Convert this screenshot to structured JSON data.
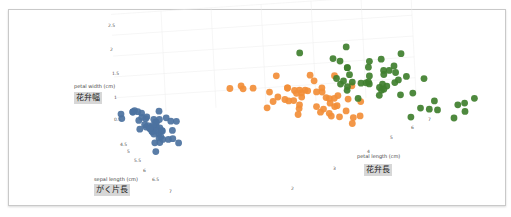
{
  "chart_data": {
    "type": "scatter",
    "projection": "3d",
    "title": "",
    "axes": {
      "x": {
        "label": "sepal length (cm)",
        "label_ja": "がく片長",
        "ticks": [
          "4.5",
          "5",
          "5.5",
          "6",
          "6.5",
          "7"
        ],
        "range": [
          4.3,
          7.9
        ]
      },
      "y": {
        "label": "petal length (cm)",
        "label_ja": "花弁長",
        "ticks": [
          "2",
          "3",
          "4",
          "5",
          "6",
          "7"
        ],
        "range": [
          1,
          6.9
        ]
      },
      "z": {
        "label": "petal width (cm)",
        "label_ja": "花弁幅",
        "ticks": [
          "0.5",
          "1",
          "1.5",
          "2",
          "2.5"
        ],
        "range": [
          0.1,
          2.5
        ]
      }
    },
    "grid": true,
    "legend": "none",
    "series": [
      {
        "name": "setosa",
        "color": "#4c72a0",
        "points": [
          [
            5.1,
            1.4,
            0.2
          ],
          [
            4.9,
            1.4,
            0.2
          ],
          [
            4.7,
            1.3,
            0.2
          ],
          [
            4.6,
            1.5,
            0.2
          ],
          [
            5.0,
            1.4,
            0.2
          ],
          [
            5.4,
            1.7,
            0.4
          ],
          [
            4.6,
            1.4,
            0.3
          ],
          [
            5.0,
            1.5,
            0.2
          ],
          [
            4.4,
            1.4,
            0.2
          ],
          [
            4.9,
            1.5,
            0.1
          ],
          [
            5.4,
            1.5,
            0.2
          ],
          [
            4.8,
            1.6,
            0.2
          ],
          [
            4.8,
            1.4,
            0.1
          ],
          [
            4.3,
            1.1,
            0.1
          ],
          [
            5.8,
            1.2,
            0.2
          ],
          [
            5.7,
            1.5,
            0.4
          ],
          [
            5.4,
            1.3,
            0.4
          ],
          [
            5.1,
            1.4,
            0.3
          ],
          [
            5.7,
            1.7,
            0.3
          ],
          [
            5.1,
            1.5,
            0.3
          ],
          [
            5.4,
            1.7,
            0.2
          ],
          [
            5.1,
            1.5,
            0.4
          ],
          [
            4.6,
            1.0,
            0.2
          ],
          [
            5.1,
            1.7,
            0.5
          ],
          [
            4.8,
            1.9,
            0.2
          ],
          [
            5.0,
            1.6,
            0.2
          ],
          [
            5.0,
            1.6,
            0.4
          ],
          [
            5.2,
            1.5,
            0.2
          ],
          [
            5.2,
            1.4,
            0.2
          ],
          [
            4.7,
            1.6,
            0.2
          ],
          [
            4.8,
            1.6,
            0.2
          ],
          [
            5.4,
            1.5,
            0.4
          ],
          [
            5.2,
            1.5,
            0.1
          ],
          [
            5.5,
            1.4,
            0.2
          ],
          [
            4.9,
            1.5,
            0.2
          ],
          [
            5.0,
            1.2,
            0.2
          ],
          [
            5.5,
            1.3,
            0.2
          ],
          [
            4.4,
            1.3,
            0.2
          ],
          [
            5.1,
            1.5,
            0.2
          ],
          [
            5.0,
            1.3,
            0.3
          ],
          [
            4.5,
            1.3,
            0.3
          ],
          [
            4.4,
            1.3,
            0.2
          ],
          [
            5.0,
            1.6,
            0.6
          ],
          [
            5.1,
            1.9,
            0.4
          ],
          [
            4.8,
            1.4,
            0.3
          ],
          [
            5.1,
            1.6,
            0.2
          ],
          [
            4.6,
            1.4,
            0.2
          ],
          [
            5.3,
            1.5,
            0.2
          ],
          [
            5.0,
            1.4,
            0.2
          ]
        ]
      },
      {
        "name": "versicolor",
        "color": "#f28e38",
        "points": [
          [
            7.0,
            4.7,
            1.4
          ],
          [
            6.4,
            4.5,
            1.5
          ],
          [
            6.9,
            4.9,
            1.5
          ],
          [
            5.5,
            4.0,
            1.3
          ],
          [
            6.5,
            4.6,
            1.5
          ],
          [
            5.7,
            4.5,
            1.3
          ],
          [
            6.3,
            4.7,
            1.6
          ],
          [
            4.9,
            3.3,
            1.0
          ],
          [
            6.6,
            4.6,
            1.3
          ],
          [
            5.2,
            3.9,
            1.4
          ],
          [
            5.0,
            3.5,
            1.0
          ],
          [
            5.9,
            4.2,
            1.5
          ],
          [
            6.0,
            4.0,
            1.0
          ],
          [
            6.1,
            4.7,
            1.4
          ],
          [
            5.6,
            3.6,
            1.3
          ],
          [
            6.7,
            4.4,
            1.4
          ],
          [
            5.6,
            4.5,
            1.5
          ],
          [
            5.8,
            4.1,
            1.0
          ],
          [
            6.2,
            4.5,
            1.5
          ],
          [
            5.6,
            3.9,
            1.1
          ],
          [
            5.9,
            4.8,
            1.8
          ],
          [
            6.1,
            4.0,
            1.3
          ],
          [
            6.3,
            4.9,
            1.5
          ],
          [
            6.1,
            4.7,
            1.2
          ],
          [
            6.4,
            4.3,
            1.3
          ],
          [
            6.6,
            4.4,
            1.4
          ],
          [
            6.8,
            4.8,
            1.4
          ],
          [
            6.7,
            5.0,
            1.7
          ],
          [
            6.0,
            4.5,
            1.5
          ],
          [
            5.7,
            3.5,
            1.0
          ],
          [
            5.5,
            3.8,
            1.1
          ],
          [
            5.5,
            3.7,
            1.0
          ],
          [
            5.8,
            3.9,
            1.2
          ],
          [
            6.0,
            5.1,
            1.6
          ],
          [
            5.4,
            4.5,
            1.5
          ],
          [
            6.0,
            4.5,
            1.6
          ],
          [
            6.7,
            4.7,
            1.5
          ],
          [
            6.3,
            4.4,
            1.3
          ],
          [
            5.6,
            4.1,
            1.3
          ],
          [
            5.5,
            4.0,
            1.3
          ],
          [
            5.5,
            4.4,
            1.2
          ],
          [
            6.1,
            4.6,
            1.4
          ],
          [
            5.8,
            4.0,
            1.2
          ],
          [
            5.0,
            3.3,
            1.0
          ],
          [
            5.6,
            4.2,
            1.3
          ],
          [
            5.7,
            4.2,
            1.2
          ],
          [
            5.7,
            4.2,
            1.3
          ],
          [
            6.2,
            4.3,
            1.3
          ],
          [
            5.1,
            3.0,
            1.1
          ],
          [
            5.7,
            4.1,
            1.3
          ]
        ]
      },
      {
        "name": "virginica",
        "color": "#3f7f2e",
        "points": [
          [
            6.3,
            6.0,
            2.5
          ],
          [
            5.8,
            5.1,
            1.9
          ],
          [
            7.1,
            5.9,
            2.1
          ],
          [
            6.3,
            5.6,
            1.8
          ],
          [
            6.5,
            5.8,
            2.2
          ],
          [
            7.6,
            6.6,
            2.1
          ],
          [
            4.9,
            4.5,
            1.7
          ],
          [
            7.3,
            6.3,
            1.8
          ],
          [
            6.7,
            5.8,
            1.8
          ],
          [
            7.2,
            6.1,
            2.5
          ],
          [
            6.5,
            5.1,
            2.0
          ],
          [
            6.4,
            5.3,
            1.9
          ],
          [
            6.8,
            5.5,
            2.1
          ],
          [
            5.7,
            5.0,
            2.0
          ],
          [
            5.8,
            5.1,
            2.4
          ],
          [
            6.4,
            5.3,
            2.3
          ],
          [
            6.5,
            5.5,
            1.8
          ],
          [
            7.7,
            6.7,
            2.2
          ],
          [
            7.7,
            6.9,
            2.3
          ],
          [
            6.0,
            5.0,
            1.5
          ],
          [
            6.9,
            5.7,
            2.3
          ],
          [
            5.6,
            4.9,
            2.0
          ],
          [
            7.7,
            6.7,
            2.0
          ],
          [
            6.3,
            4.9,
            1.8
          ],
          [
            6.7,
            5.7,
            2.1
          ],
          [
            7.2,
            6.0,
            1.8
          ],
          [
            6.2,
            4.8,
            1.8
          ],
          [
            6.1,
            4.9,
            1.8
          ],
          [
            6.4,
            5.6,
            2.1
          ],
          [
            7.2,
            5.8,
            1.6
          ],
          [
            7.4,
            6.1,
            1.9
          ],
          [
            7.9,
            6.4,
            2.0
          ],
          [
            6.4,
            5.6,
            2.2
          ],
          [
            6.3,
            5.1,
            1.5
          ],
          [
            6.1,
            5.6,
            1.4
          ],
          [
            7.7,
            6.1,
            2.3
          ],
          [
            6.3,
            5.6,
            2.4
          ],
          [
            6.4,
            5.5,
            1.8
          ],
          [
            6.0,
            4.8,
            1.8
          ],
          [
            6.9,
            5.4,
            2.1
          ],
          [
            6.7,
            5.6,
            2.4
          ],
          [
            6.9,
            5.1,
            2.3
          ],
          [
            5.8,
            5.1,
            1.9
          ],
          [
            6.8,
            5.9,
            2.3
          ],
          [
            6.7,
            5.7,
            2.5
          ],
          [
            6.7,
            5.2,
            2.3
          ],
          [
            6.3,
            5.0,
            1.9
          ],
          [
            6.5,
            5.2,
            2.0
          ],
          [
            6.2,
            5.4,
            2.3
          ],
          [
            5.9,
            5.1,
            1.8
          ]
        ]
      }
    ]
  }
}
